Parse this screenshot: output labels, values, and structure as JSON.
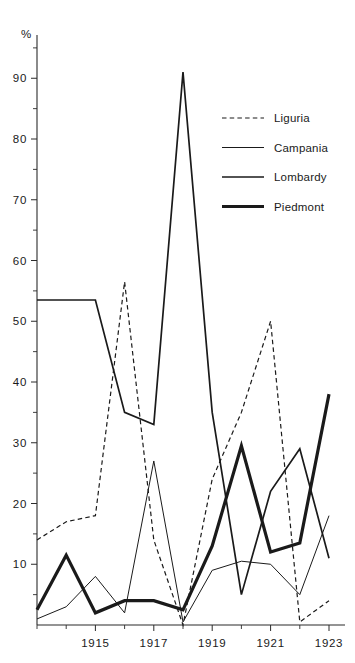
{
  "chart_data": {
    "type": "line",
    "title": "",
    "subtitle": "",
    "xlabel": "",
    "ylabel": "%",
    "y_unit_symbol": "%",
    "x": [
      1913,
      1914,
      1915,
      1916,
      1917,
      1918,
      1919,
      1920,
      1921,
      1922,
      1923
    ],
    "xlim": [
      1913,
      1923
    ],
    "ylim": [
      0,
      95
    ],
    "x_tick_labels": [
      "1915",
      "1917",
      "1919",
      "1921",
      "1923"
    ],
    "x_tick_values": [
      1915,
      1917,
      1919,
      1921,
      1923
    ],
    "x_minor_tick_values": [
      1913,
      1914,
      1916,
      1918,
      1920,
      1922
    ],
    "y_tick_labels": [
      "10",
      "20",
      "30",
      "40",
      "50",
      "60",
      "70",
      "80",
      "90"
    ],
    "y_tick_values": [
      10,
      20,
      30,
      40,
      50,
      60,
      70,
      80,
      90
    ],
    "y_minor_tick_values": [
      5,
      15,
      25,
      35,
      45,
      55,
      65,
      75,
      85,
      95
    ],
    "grid": false,
    "legend_position": "top-right",
    "series": [
      {
        "name": "Liguria",
        "style": "dashed",
        "color": "#1a1a1a",
        "width": 1.2,
        "values": [
          14.0,
          17.0,
          18.0,
          56.5,
          14.0,
          0.0,
          24.0,
          35.0,
          50.0,
          0.5,
          4.0
        ]
      },
      {
        "name": "Campania",
        "style": "thin",
        "color": "#1a1a1a",
        "width": 1.0,
        "values": [
          1.0,
          3.0,
          8.0,
          2.0,
          27.0,
          0.5,
          9.0,
          10.5,
          10.0,
          5.0,
          18.0
        ]
      },
      {
        "name": "Lombardy",
        "style": "medium",
        "color": "#1a1a1a",
        "width": 1.7,
        "values": [
          53.5,
          53.5,
          53.5,
          35.0,
          33.0,
          91.0,
          35.0,
          5.0,
          22.0,
          29.0,
          11.0
        ]
      },
      {
        "name": "Piedmont",
        "style": "thick",
        "color": "#1a1a1a",
        "width": 3.2,
        "values": [
          2.5,
          11.5,
          2.0,
          4.0,
          4.0,
          2.5,
          13.0,
          29.5,
          12.0,
          13.5,
          38.0
        ]
      }
    ]
  },
  "legend": {
    "items": [
      {
        "label": "Liguria",
        "style": "dashed"
      },
      {
        "label": "Campania",
        "style": "thin"
      },
      {
        "label": "Lombardy",
        "style": "medium"
      },
      {
        "label": "Piedmont",
        "style": "thick"
      }
    ]
  }
}
